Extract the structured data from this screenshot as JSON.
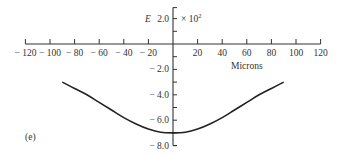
{
  "chart_data": {
    "type": "line",
    "panel_label": "(e)",
    "title": "",
    "xlabel": "Microns",
    "ylabel": "E",
    "y_multiplier": "× 10²",
    "xlim": [
      -120,
      120
    ],
    "ylim": [
      -8.0,
      2.0
    ],
    "x_ticks": [
      -120,
      -100,
      -80,
      -60,
      -40,
      -20,
      20,
      40,
      60,
      80,
      100,
      120
    ],
    "x_tick_labels": [
      "− 120",
      "− 100",
      "− 80",
      "− 60",
      "− 40",
      "− 20",
      "20",
      "40",
      "60",
      "80",
      "100",
      "120"
    ],
    "y_ticks": [
      2.0,
      -2.0,
      -4.0,
      -6.0,
      -8.0
    ],
    "y_tick_labels": [
      "2.0",
      "− 2.0",
      "− 4.0",
      "− 6.0",
      "− 8.0"
    ],
    "y_minor_step": 1.0,
    "grid": false,
    "legend": null,
    "series": [
      {
        "name": "E",
        "x": [
          -90,
          -80,
          -70,
          -60,
          -50,
          -40,
          -30,
          -20,
          -10,
          0,
          10,
          20,
          30,
          40,
          50,
          60,
          70,
          80,
          90
        ],
        "y": [
          -3.0,
          -3.5,
          -4.0,
          -4.6,
          -5.2,
          -5.8,
          -6.3,
          -6.7,
          -6.95,
          -7.0,
          -6.95,
          -6.7,
          -6.3,
          -5.8,
          -5.2,
          -4.6,
          -4.0,
          -3.5,
          -3.0
        ]
      }
    ]
  },
  "labels": {
    "panel": "(e)",
    "y_axis_name": "E",
    "y_top_value": "2.0",
    "multiplier": "× 10",
    "multiplier_exp": "2",
    "x_axis_title": "Microns"
  }
}
